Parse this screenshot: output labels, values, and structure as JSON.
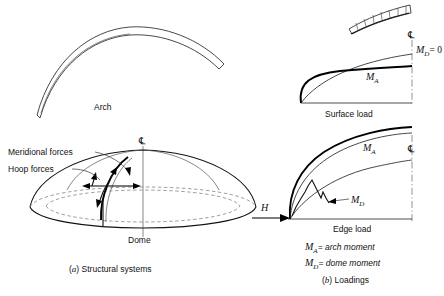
{
  "figure": {
    "panel_a": {
      "caption_prefix": "(",
      "caption_letter": "a",
      "caption_suffix": ")",
      "caption_text": "Structural systems",
      "arch": {
        "label": "Arch"
      },
      "dome": {
        "label": "Dome",
        "centerline_symbol": "℄",
        "annotations": [
          {
            "id": "meridional",
            "label": "Meridional forces"
          },
          {
            "id": "hoop",
            "label": "Hoop forces"
          }
        ]
      }
    },
    "panel_b": {
      "caption_prefix": "(",
      "caption_letter": "b",
      "caption_suffix": ")",
      "caption_text": "Loadings",
      "surface_load": {
        "label": "Surface load",
        "centerline_symbol": "℄",
        "curve_labels": [
          {
            "id": "arch-moment",
            "symbol": "M",
            "subscript": "A"
          },
          {
            "id": "dome-moment-zero",
            "symbol": "M",
            "subscript": "D",
            "value": "= 0"
          }
        ]
      },
      "edge_load": {
        "label": "Edge load",
        "centerline_symbol": "℄",
        "force_label": "H",
        "curve_labels": [
          {
            "id": "arch-moment",
            "symbol": "M",
            "subscript": "A"
          },
          {
            "id": "dome-moment",
            "symbol": "M",
            "subscript": "D"
          }
        ]
      },
      "legend": [
        {
          "symbol": "M",
          "subscript": "A",
          "definition": "= arch moment"
        },
        {
          "symbol": "M",
          "subscript": "D",
          "definition": "= dome moment"
        }
      ]
    }
  }
}
